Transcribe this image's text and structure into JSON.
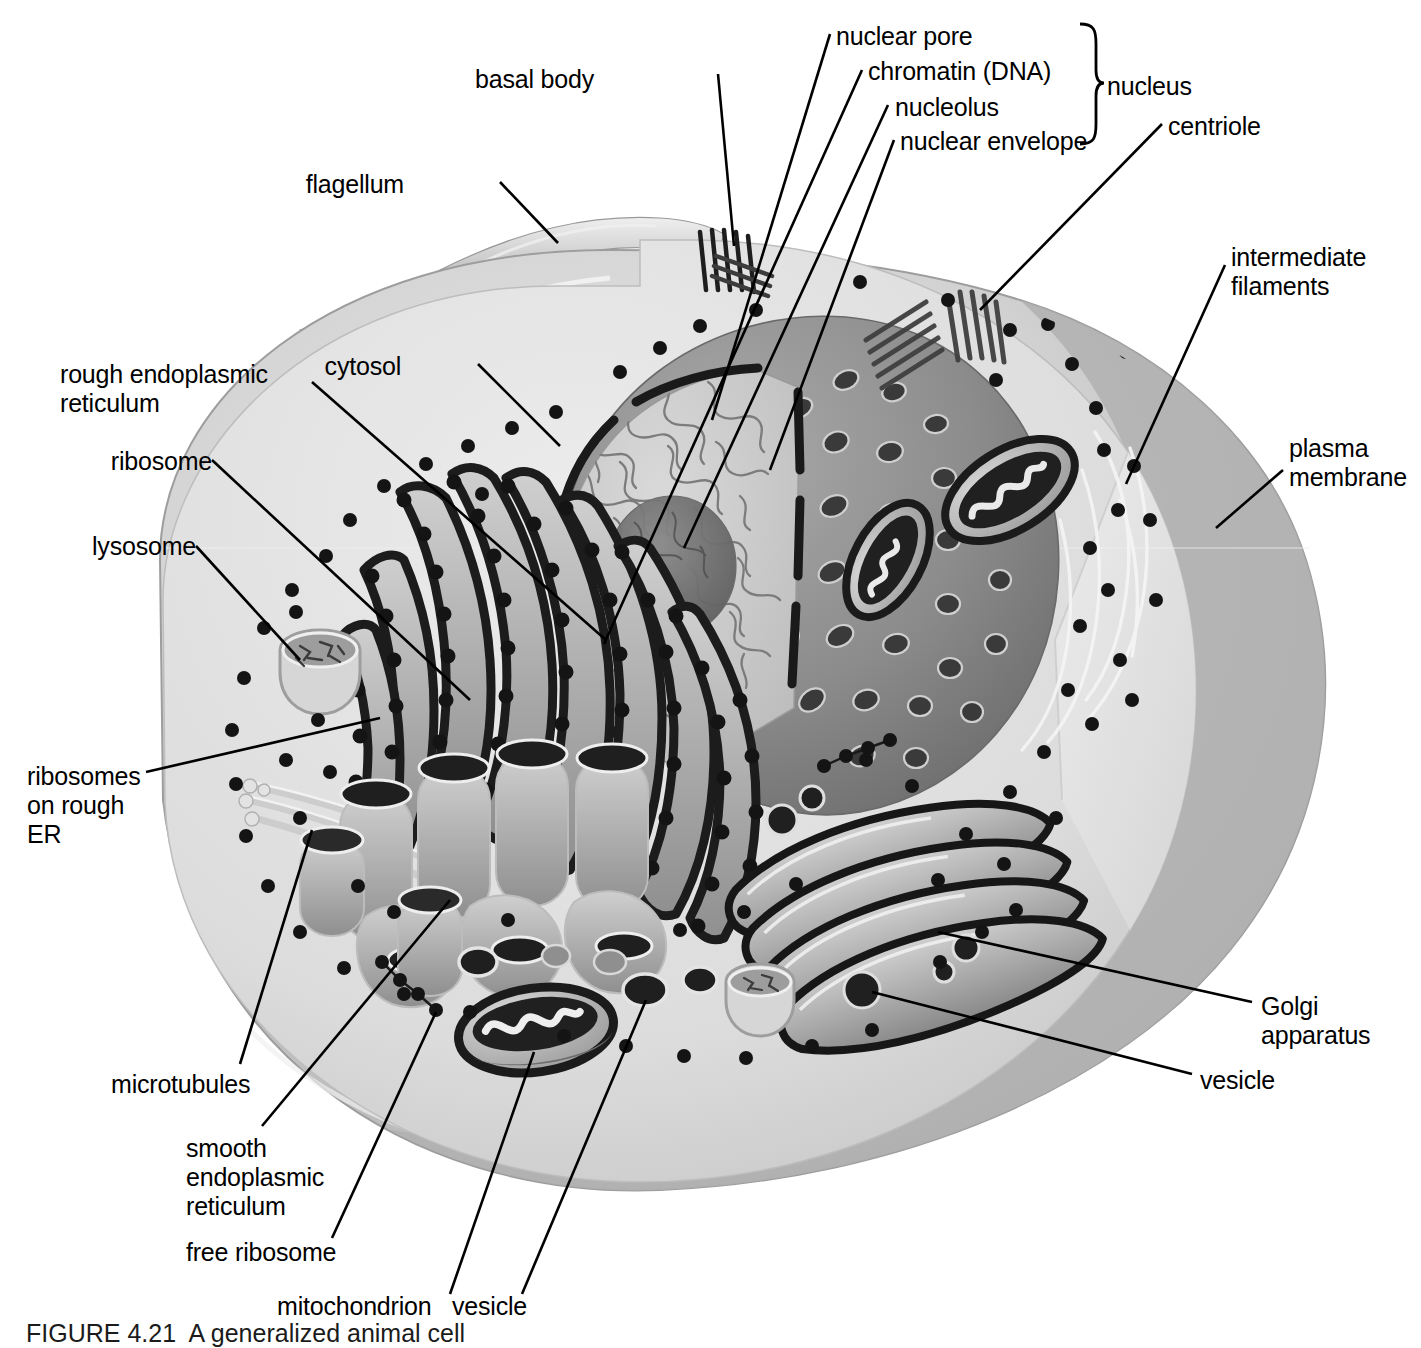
{
  "figure": {
    "caption": "FIGURE 4.21  A generalized animal cell",
    "title": "A generalized animal cell",
    "type": "labeled biological diagram"
  },
  "colors": {
    "background": "#ffffff",
    "ink": "#000000",
    "cytosol_light": "#e2e2e2",
    "cytosol_mid": "#cfcfcf",
    "cell_shadow": "#b4b4b4",
    "cell_dark": "#a8a8a8",
    "nucleus_envelope": "#8e8e8e",
    "nucleoplasm": "#c9c9c9",
    "nucleolus": "#6e6e6e",
    "organelle_dark": "#2b2b2b",
    "organelle_mid": "#7a7a7a",
    "highlight": "#f2f2f2"
  },
  "labels": [
    {
      "id": "nuclear-pore",
      "text": "nuclear pore",
      "align": "left",
      "x": 836,
      "y": 22,
      "group": "nucleus"
    },
    {
      "id": "chromatin",
      "text": "chromatin (DNA)",
      "align": "left",
      "x": 868,
      "y": 57,
      "group": "nucleus"
    },
    {
      "id": "nucleolus",
      "text": "nucleolus",
      "align": "left",
      "x": 895,
      "y": 93,
      "group": "nucleus"
    },
    {
      "id": "nuclear-envelope",
      "text": "nuclear envelope",
      "align": "left",
      "x": 900,
      "y": 127,
      "group": "nucleus"
    },
    {
      "id": "nucleus",
      "text": "nucleus",
      "align": "left",
      "x": 1107,
      "y": 72,
      "group": "bracket-label"
    },
    {
      "id": "basal-body",
      "text": "basal body",
      "align": "right",
      "x": 594,
      "y": 65
    },
    {
      "id": "centriole",
      "text": "centriole",
      "align": "left",
      "x": 1168,
      "y": 112
    },
    {
      "id": "intermediate-filaments",
      "text": "intermediate\nfilaments",
      "align": "left",
      "x": 1231,
      "y": 243
    },
    {
      "id": "plasma-membrane",
      "text": "plasma\nmembrane",
      "align": "left",
      "x": 1289,
      "y": 434
    },
    {
      "id": "flagellum",
      "text": "flagellum",
      "align": "right",
      "x": 404,
      "y": 170
    },
    {
      "id": "cytosol",
      "text": "cytosol",
      "align": "right",
      "x": 401,
      "y": 352
    },
    {
      "id": "rough-er",
      "text": "rough endoplasmic\nreticulum",
      "align": "right",
      "x": 120,
      "y": 360
    },
    {
      "id": "ribosome",
      "text": "ribosome",
      "align": "right",
      "x": 122,
      "y": 447
    },
    {
      "id": "lysosome",
      "text": "lysosome",
      "align": "right",
      "x": 101,
      "y": 532
    },
    {
      "id": "ribosomes-on-rough-er",
      "text": "ribosomes\non rough\nER",
      "align": "left",
      "x": 27,
      "y": 762
    },
    {
      "id": "microtubules",
      "text": "microtubules",
      "align": "left",
      "x": 111,
      "y": 1070
    },
    {
      "id": "smooth-er",
      "text": "smooth\nendoplasmic\nreticulum",
      "align": "left",
      "x": 186,
      "y": 1134
    },
    {
      "id": "free-ribosome",
      "text": "free ribosome",
      "align": "left",
      "x": 186,
      "y": 1238
    },
    {
      "id": "mitochondrion",
      "text": "mitochondrion",
      "align": "left",
      "x": 277,
      "y": 1292
    },
    {
      "id": "vesicle-bottom",
      "text": "vesicle",
      "align": "left",
      "x": 452,
      "y": 1292
    },
    {
      "id": "golgi-apparatus",
      "text": "Golgi\napparatus",
      "align": "left",
      "x": 1261,
      "y": 992
    },
    {
      "id": "vesicle-right",
      "text": "vesicle",
      "align": "left",
      "x": 1200,
      "y": 1066
    }
  ],
  "structures": [
    {
      "id": "flagellum",
      "name": "flagellum"
    },
    {
      "id": "basal-body",
      "name": "basal body"
    },
    {
      "id": "plasma-membrane",
      "name": "plasma membrane"
    },
    {
      "id": "cytosol",
      "name": "cytosol"
    },
    {
      "id": "nucleus",
      "name": "nucleus"
    },
    {
      "id": "nuclear-envelope",
      "name": "nuclear envelope"
    },
    {
      "id": "nuclear-pore",
      "name": "nuclear pore"
    },
    {
      "id": "chromatin",
      "name": "chromatin (DNA)"
    },
    {
      "id": "nucleolus",
      "name": "nucleolus"
    },
    {
      "id": "rough-er",
      "name": "rough endoplasmic reticulum"
    },
    {
      "id": "smooth-er",
      "name": "smooth endoplasmic reticulum"
    },
    {
      "id": "ribosome",
      "name": "ribosome"
    },
    {
      "id": "free-ribosome",
      "name": "free ribosome"
    },
    {
      "id": "golgi-apparatus",
      "name": "Golgi apparatus"
    },
    {
      "id": "mitochondrion",
      "name": "mitochondrion"
    },
    {
      "id": "lysosome",
      "name": "lysosome"
    },
    {
      "id": "vesicle",
      "name": "vesicle"
    },
    {
      "id": "centriole",
      "name": "centriole"
    },
    {
      "id": "microtubules",
      "name": "microtubules"
    },
    {
      "id": "intermediate-filaments",
      "name": "intermediate filaments"
    }
  ]
}
